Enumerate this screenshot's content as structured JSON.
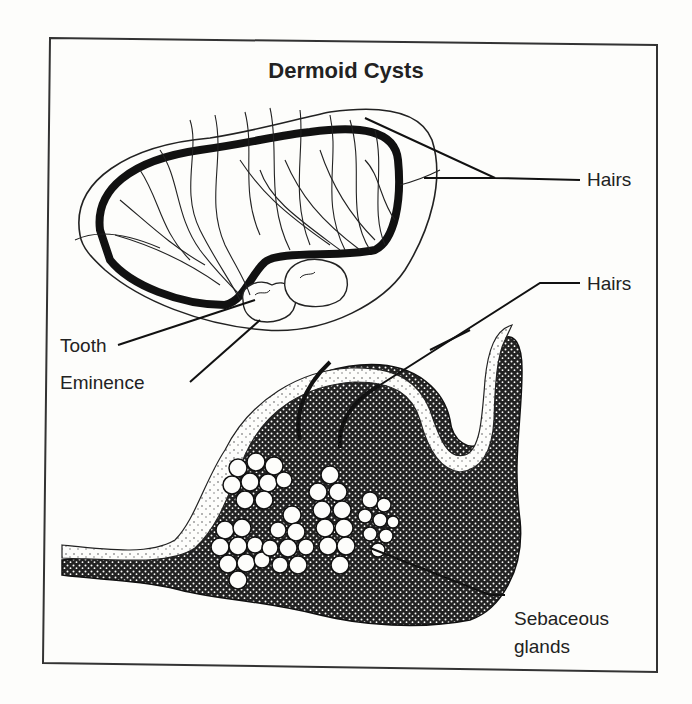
{
  "figure": {
    "title": "Dermoid Cysts",
    "labels": {
      "hairs_upper": "Hairs",
      "hairs_lower": "Hairs",
      "tooth": "Tooth",
      "eminence": "Eminence",
      "sebaceous_line1": "Sebaceous",
      "sebaceous_line2": "glands"
    },
    "colors": {
      "ink": "#1a1a1a",
      "paper": "#fdfdfb"
    }
  }
}
